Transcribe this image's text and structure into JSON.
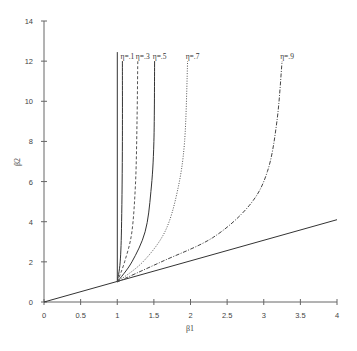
{
  "chart_data": {
    "type": "line",
    "title": "",
    "xlabel": "β1",
    "ylabel": "β2",
    "xlim": [
      0,
      4
    ],
    "ylim": [
      0,
      14
    ],
    "grid": false,
    "legend": "inline labels at top of curves",
    "x_ticks": [
      "0",
      "0.5",
      "1",
      "1.5",
      "2",
      "2.5",
      "3",
      "3.5",
      "4"
    ],
    "y_ticks": [
      "0",
      "2",
      "4",
      "6",
      "8",
      "10",
      "12",
      "14"
    ],
    "series": [
      {
        "name": "boundary β2 = β1",
        "style": "solid",
        "points": [
          [
            0,
            0
          ],
          [
            4,
            4.1
          ]
        ]
      },
      {
        "name": "η=0 boundary",
        "style": "solid",
        "points": [
          [
            1,
            1
          ],
          [
            1,
            12.45
          ]
        ]
      },
      {
        "name": "η=.1",
        "label": "η=.1",
        "style": "solid",
        "points": [
          [
            1,
            1
          ],
          [
            1.04,
            2
          ],
          [
            1.06,
            4
          ],
          [
            1.07,
            8
          ],
          [
            1.07,
            12
          ]
        ]
      },
      {
        "name": "η=.3",
        "label": "η=.3",
        "style": "dashed",
        "points": [
          [
            1,
            1
          ],
          [
            1.1,
            2
          ],
          [
            1.2,
            3.5
          ],
          [
            1.25,
            6
          ],
          [
            1.27,
            9
          ],
          [
            1.28,
            12
          ]
        ]
      },
      {
        "name": "η=.5",
        "label": "η=.5",
        "style": "solid",
        "points": [
          [
            1,
            1
          ],
          [
            1.2,
            2
          ],
          [
            1.38,
            3.5
          ],
          [
            1.46,
            5.5
          ],
          [
            1.5,
            8
          ],
          [
            1.51,
            12
          ]
        ]
      },
      {
        "name": "η=.7",
        "label": "η=.7",
        "style": "dotted",
        "points": [
          [
            1,
            1
          ],
          [
            1.35,
            2
          ],
          [
            1.65,
            3.5
          ],
          [
            1.82,
            5.5
          ],
          [
            1.92,
            8
          ],
          [
            1.96,
            12
          ]
        ]
      },
      {
        "name": "η=.9",
        "label": "η=.9",
        "style": "dash-dot",
        "points": [
          [
            1,
            1
          ],
          [
            1.6,
            2
          ],
          [
            2.3,
            3.2
          ],
          [
            2.8,
            4.8
          ],
          [
            3.05,
            6.5
          ],
          [
            3.18,
            9
          ],
          [
            3.25,
            12
          ]
        ]
      }
    ]
  },
  "labels": {
    "xlabel": "β1",
    "ylabel": "β2",
    "curves": [
      "η=.1",
      "η=.3",
      "η=.5",
      "η=.7",
      "η=.9"
    ]
  }
}
